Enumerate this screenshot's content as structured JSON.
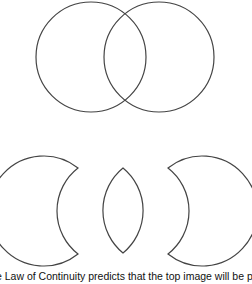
{
  "figure": {
    "top_image": {
      "description": "two overlapping circles",
      "circles": [
        {
          "cx": 91,
          "cy": 57,
          "r": 55
        },
        {
          "cx": 159,
          "cy": 57,
          "r": 55
        }
      ]
    },
    "bottom_image": {
      "description": "three separate shapes: left crescent, central lens, right crescent",
      "shapes": [
        "left-crescent",
        "lens",
        "right-crescent"
      ]
    },
    "stroke_color": "#444444",
    "fill_color": "#ffffff"
  },
  "caption": "e Law of Continuity predicts that the top image will be perceive"
}
